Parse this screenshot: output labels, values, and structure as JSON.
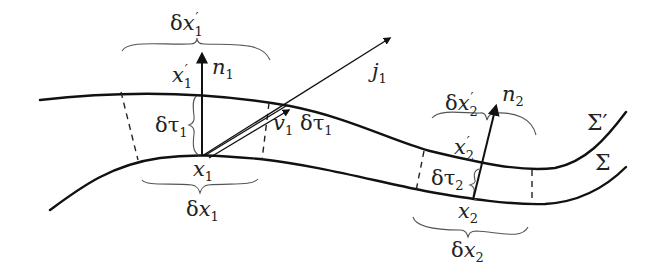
{
  "diagram": {
    "surfaces": [
      {
        "id": "sigma-prime",
        "label": "Σ′"
      },
      {
        "id": "sigma",
        "label": "Σ"
      }
    ],
    "labels": {
      "dx1_prime": {
        "base": "δ",
        "var": "x",
        "prime": "′",
        "sub": "1"
      },
      "n1": {
        "var": "n",
        "sub": "1"
      },
      "x1_prime": {
        "var": "x",
        "prime": "′",
        "sub": "1"
      },
      "dtau1_left": {
        "base": "δτ",
        "sub": "1"
      },
      "x1": {
        "var": "x",
        "sub": "1"
      },
      "dx1": {
        "base": "δ",
        "var": "x",
        "sub": "1"
      },
      "j1": {
        "var": "j",
        "sub": "1"
      },
      "v1": {
        "var": "v",
        "sub": "1"
      },
      "dtau1_right": {
        "base": "δτ",
        "sub": "1"
      },
      "dx2_prime": {
        "base": "δ",
        "var": "x",
        "prime": "′",
        "sub": "2"
      },
      "n2": {
        "var": "n",
        "sub": "2"
      },
      "x2_prime": {
        "var": "x",
        "prime": "′",
        "sub": "2"
      },
      "dtau2": {
        "base": "δτ",
        "sub": "2"
      },
      "x2": {
        "var": "x",
        "sub": "2"
      },
      "dx2": {
        "base": "δ",
        "var": "x",
        "sub": "2"
      }
    },
    "arrows": [
      {
        "id": "n1",
        "from": "x1",
        "to": "n1",
        "meaning": "normal at x1"
      },
      {
        "id": "j1",
        "from": "x1",
        "to": "j1",
        "meaning": "current vector"
      },
      {
        "id": "v1",
        "from": "x1",
        "to": "x1-prime side",
        "meaning": "v1 δτ1 displacement"
      },
      {
        "id": "n2",
        "from": "x2",
        "to": "n2",
        "meaning": "normal at x2"
      }
    ]
  }
}
